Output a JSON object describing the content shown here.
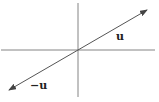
{
  "diagram": {
    "type": "vector-negation",
    "axes": {
      "horizontal": {
        "x1": 1,
        "y1": 50,
        "x2": 155,
        "y2": 50
      },
      "vertical": {
        "x1": 78,
        "y1": 3,
        "x2": 78,
        "y2": 97
      },
      "color": "#777777"
    },
    "vector_u": {
      "label": "u",
      "from": [
        78,
        50
      ],
      "to": [
        147,
        10
      ],
      "label_pos": [
        116,
        40
      ]
    },
    "vector_neg_u": {
      "label": "−u",
      "from": [
        78,
        50
      ],
      "to": [
        9,
        90
      ],
      "label_pos": [
        30,
        89
      ]
    },
    "vector_color": "#555555"
  }
}
